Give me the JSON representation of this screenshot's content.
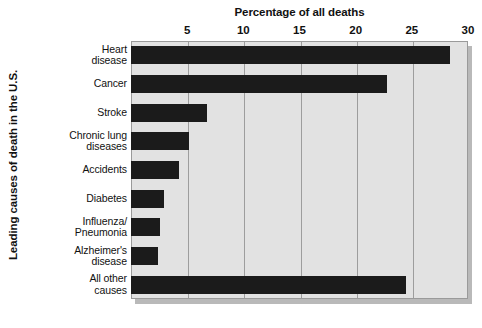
{
  "chart_data": {
    "type": "bar",
    "orientation": "horizontal",
    "title": "Percentage of all deaths",
    "xlabel": "Percentage of all deaths",
    "ylabel": "Leading causes of death in the U.S.",
    "categories": [
      "Heart disease",
      "Cancer",
      "Stroke",
      "Chronic lung diseases",
      "Accidents",
      "Diabetes",
      "Influenza/ Pneumonia",
      "Alzheimer's disease",
      "All other causes"
    ],
    "category_lines": [
      [
        "Heart",
        "disease"
      ],
      [
        "Cancer"
      ],
      [
        "Stroke"
      ],
      [
        "Chronic lung",
        "diseases"
      ],
      [
        "Accidents"
      ],
      [
        "Diabetes"
      ],
      [
        "Influenza/",
        "Pneumonia"
      ],
      [
        "Alzheimer's",
        "disease"
      ],
      [
        "All other",
        "causes"
      ]
    ],
    "values": [
      28.4,
      22.8,
      6.8,
      5.2,
      4.3,
      2.9,
      2.6,
      2.4,
      24.5
    ],
    "xlim": [
      0,
      30
    ],
    "xticks": [
      5,
      10,
      15,
      20,
      25,
      30
    ],
    "xticklabels": [
      "5",
      "10",
      "15",
      "20",
      "25",
      "30"
    ],
    "grid": true,
    "legend": null,
    "bar_color": "#1b1b1b",
    "plot_background": "#e2e2e2",
    "gridline_color": "#9d9d9d",
    "page_background": "#ffffff"
  }
}
